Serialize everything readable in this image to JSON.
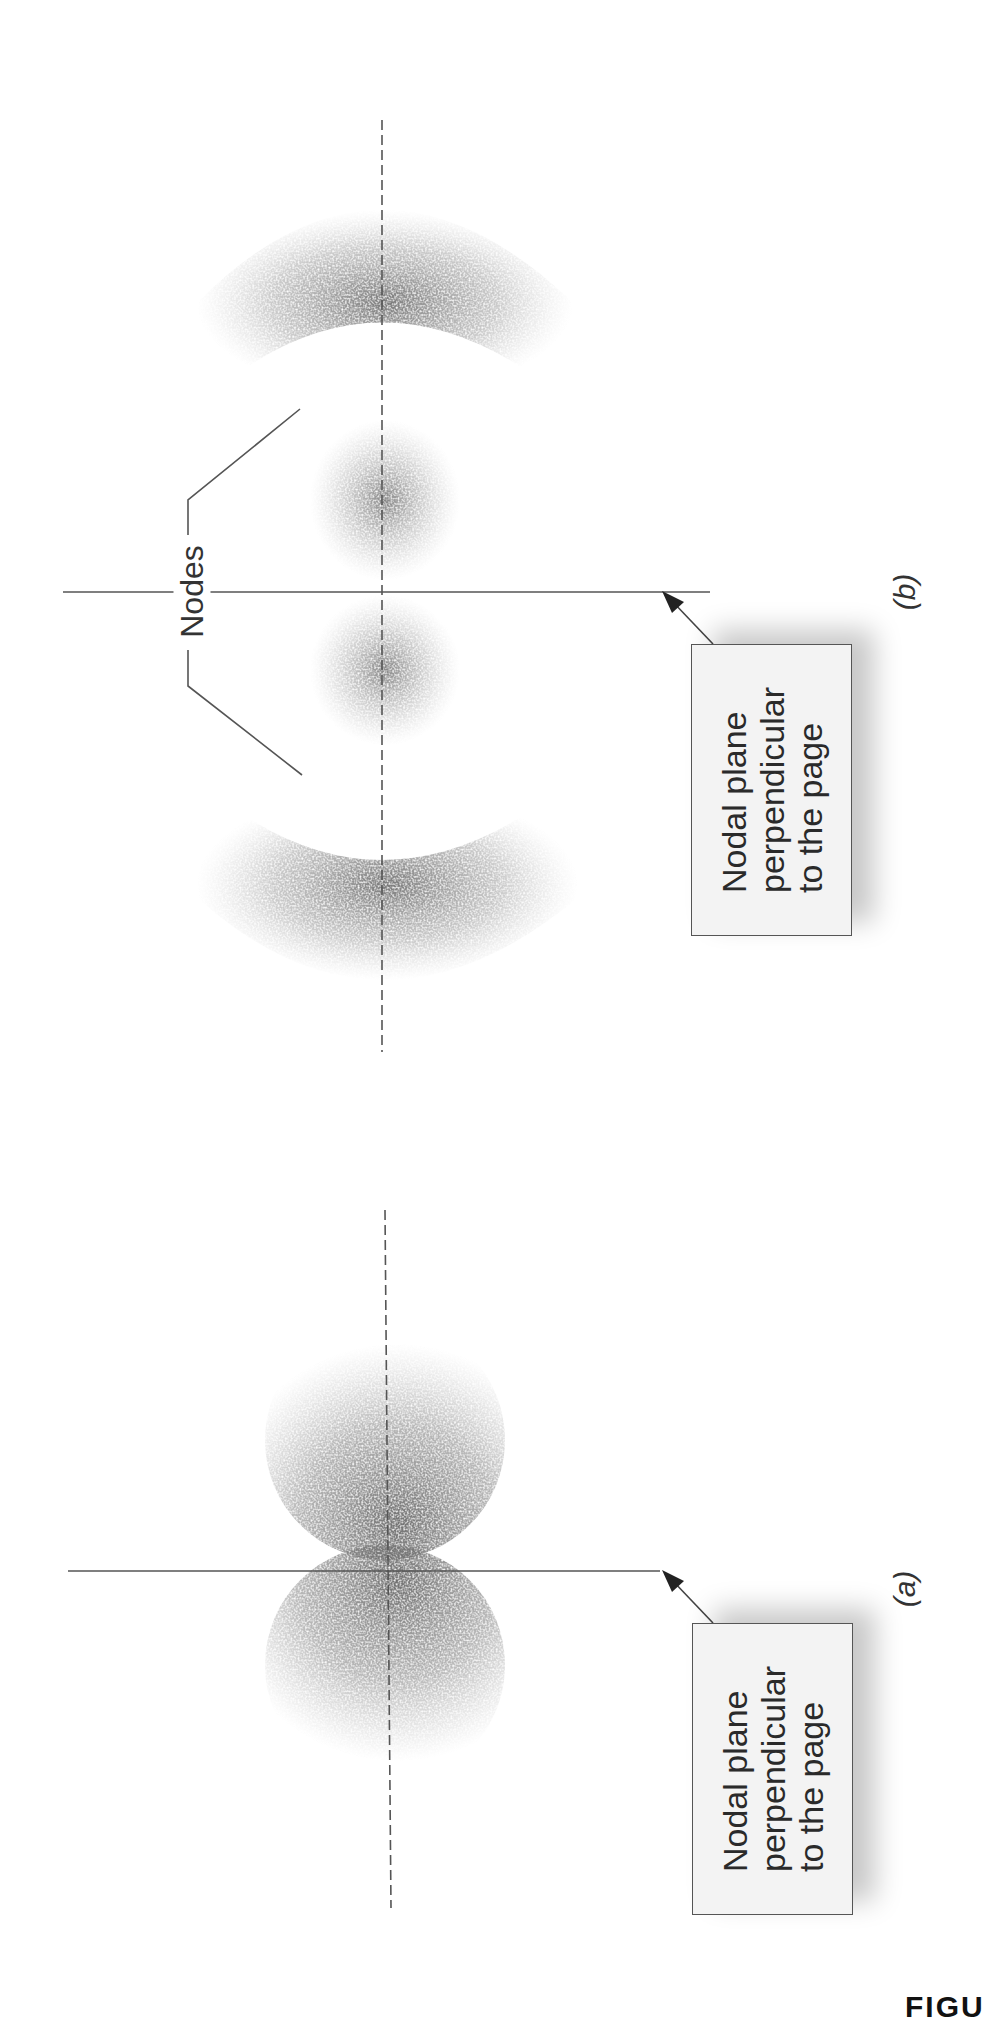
{
  "figure": {
    "panels": [
      {
        "id": "a",
        "label": "(a)",
        "description": "p orbital with one nodal plane, two lobes",
        "nodal_plane_label": {
          "lines": [
            "Nodal plane",
            "perpendicular",
            "to the page"
          ]
        }
      },
      {
        "id": "b",
        "label": "(b)",
        "description": "higher p orbital with nodal plane and radial nodes",
        "nodes_label": "Nodes",
        "nodal_plane_label": {
          "lines": [
            "Nodal plane",
            "perpendicular",
            "to the page"
          ]
        }
      }
    ],
    "caption_fragment": "FIGU",
    "colors": {
      "stipple": "#6a6a6a",
      "line": "#555555",
      "box_fill": "#f3f3f3",
      "background": "#ffffff"
    }
  }
}
